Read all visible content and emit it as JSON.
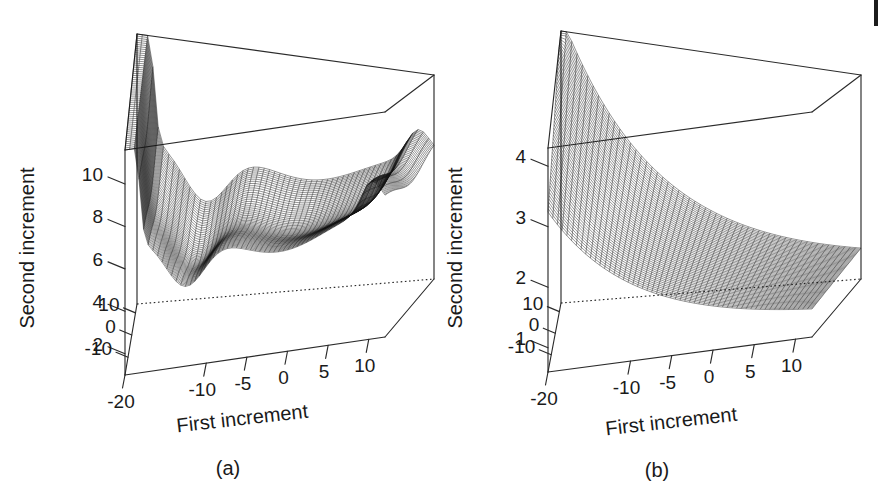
{
  "figure": {
    "caption_left": "(a)",
    "caption_right": "(b)",
    "page_mark": "page-edge-artifact"
  },
  "chart_data": [
    {
      "type": "surface",
      "id": "panel-a",
      "title": "(a)",
      "xlabel": "First increment",
      "ylabel": "Second increment",
      "zlabel": "",
      "xticks": [
        -20,
        -10,
        -5,
        0,
        5,
        10
      ],
      "xtick_labels": [
        "-20",
        "-10",
        "-5",
        "0",
        "5",
        "10"
      ],
      "yticks": [
        -10,
        0,
        10
      ],
      "ytick_labels": [
        "-10",
        "0",
        "10"
      ],
      "zticks": [
        2,
        4,
        6,
        8,
        10
      ],
      "ztick_labels": [
        "2",
        "4",
        "6",
        "8",
        "10"
      ],
      "xlim": [
        -20,
        12
      ],
      "ylim": [
        -18,
        14
      ],
      "zlim": [
        1.0,
        11.6
      ],
      "grid": false,
      "legend": "none",
      "surface_note": "fine wireframe mesh; tall narrow ridge at left edge near x=-20 rising to top of box, deep valley near x=-12, broad low basin across centre, small crest near x=10",
      "nx": 56,
      "ny": 56
    },
    {
      "type": "surface",
      "id": "panel-b",
      "title": "(b)",
      "xlabel": "First increment",
      "ylabel": "Second increment",
      "zlabel": "",
      "xticks": [
        -20,
        -10,
        -5,
        0,
        5,
        10
      ],
      "xtick_labels": [
        "-20",
        "-10",
        "-5",
        "0",
        "5",
        "10"
      ],
      "yticks": [
        -10,
        0,
        10
      ],
      "ytick_labels": [
        "-10",
        "0",
        "10"
      ],
      "zticks": [
        1,
        2,
        3,
        4
      ],
      "ztick_labels": [
        "1",
        "2",
        "3",
        "4"
      ],
      "xlim": [
        -20,
        12
      ],
      "ylim": [
        -18,
        14
      ],
      "zlim": [
        0.6,
        4.3
      ],
      "grid": false,
      "legend": "none",
      "surface_note": "monotone wireframe sheet, highest at back-left corner near z=4.2 decaying smoothly toward the front-right corner near z=1",
      "nx": 56,
      "ny": 56
    }
  ],
  "panels": [
    {
      "name": "panel-a",
      "caption": "(a)",
      "x_axis_title": "First increment",
      "y_axis_title": "Second increment",
      "x_tick_labels": [
        "-20",
        "-10",
        "-5",
        "0",
        "5",
        "10"
      ],
      "y_tick_labels": [
        "10",
        "0",
        "-10"
      ],
      "z_tick_labels": [
        "10",
        "8",
        "6",
        "4",
        "2"
      ]
    },
    {
      "name": "panel-b",
      "caption": "(b)",
      "x_axis_title": "First increment",
      "y_axis_title": "Second increment",
      "x_tick_labels": [
        "-20",
        "-10",
        "-5",
        "0",
        "5",
        "10"
      ],
      "y_tick_labels": [
        "10",
        "0",
        "-10"
      ],
      "z_tick_labels": [
        "4",
        "3",
        "2",
        "1"
      ]
    }
  ],
  "colors": {
    "background": "#ffffff",
    "ink": "#1a1a1a",
    "mesh": "#121212",
    "box": "#2b2b2b"
  }
}
